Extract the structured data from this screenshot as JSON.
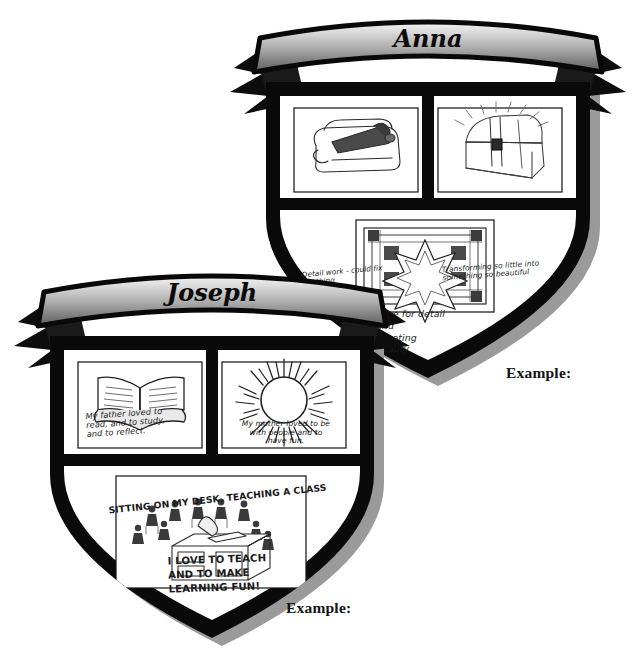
{
  "page": {
    "background_color": "#ffffff",
    "ink_color": "#1b1b1b",
    "outline_color": "#000000",
    "shadow_color": "#8a8a8a",
    "banner_gradient_top": "#f2f2f2",
    "banner_gradient_bottom": "#6e6e6e"
  },
  "crests": [
    {
      "id": "anna",
      "banner_name": "Anna",
      "example_label": "Example:",
      "panels": [
        {
          "id": "anna-panel-top-left",
          "position": "top-left",
          "sketch": "toolbox-sketch",
          "caption": "Detail work - could fix\nanything"
        },
        {
          "id": "anna-panel-top-right",
          "position": "top-right",
          "sketch": "treasure-chest-sketch",
          "caption": "Transforming so little into\nsomething  so beautiful"
        },
        {
          "id": "anna-panel-bottom",
          "position": "bottom",
          "sketch": "star-quilt-sketch",
          "caption_below": "Love for detail\nand\nCreating\nbeauty"
        }
      ]
    },
    {
      "id": "joseph",
      "banner_name": "Joseph",
      "example_label": "Example:",
      "panels": [
        {
          "id": "joseph-panel-top-left",
          "position": "top-left",
          "sketch": "open-book-sketch",
          "caption": "My father loved to\nread, and to study,\nand to reflect."
        },
        {
          "id": "joseph-panel-top-right",
          "position": "top-right",
          "sketch": "sun-sketch",
          "caption": "My mother loved to be\nwith people and to\nhave fun."
        },
        {
          "id": "joseph-panel-bottom",
          "position": "bottom",
          "sketch": "classroom-desk-sketch",
          "caption_above": "Sitting on my desk, teaching a class",
          "caption_below": "I love to teach\nand to make\nlearning fun!"
        }
      ]
    }
  ]
}
